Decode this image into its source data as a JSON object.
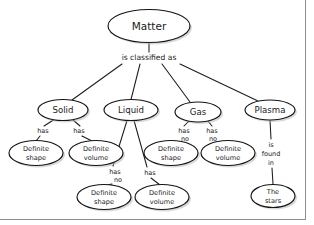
{
  "diagram": {
    "type": "concept-map",
    "ink_color": "#1a1a1a",
    "background_color": "#ffffff",
    "border_color": "#8d8d8d"
  },
  "nodes": {
    "root": {
      "label": "Matter",
      "cx": 149,
      "cy": 26,
      "rx": 41,
      "ry": 16.5
    },
    "solid": {
      "label": "Solid",
      "cx": 63,
      "cy": 110,
      "rx": 25,
      "ry": 10.5
    },
    "liquid": {
      "label": "Liquid",
      "cx": 131,
      "cy": 110,
      "rx": 27,
      "ry": 10.5
    },
    "gas": {
      "label": "Gas",
      "cx": 198,
      "cy": 112,
      "rx": 23,
      "ry": 10
    },
    "plasma": {
      "label": "Plasma",
      "cx": 270,
      "cy": 110,
      "rx": 25,
      "ry": 10
    },
    "solid_shape": {
      "line1": "Definite",
      "line2": "shape",
      "cx": 36,
      "cy": 153,
      "rx": 27,
      "ry": 12.5
    },
    "solid_volume": {
      "line1": "Definite",
      "line2": "volume",
      "cx": 96,
      "cy": 153,
      "rx": 27,
      "ry": 12.5
    },
    "gas_shape": {
      "line1": "Definite",
      "line2": "shape",
      "cx": 171,
      "cy": 153,
      "rx": 27,
      "ry": 12.5
    },
    "gas_volume": {
      "line1": "Definite",
      "line2": "volume",
      "cx": 228,
      "cy": 153,
      "rx": 27,
      "ry": 12.5
    },
    "liquid_shape": {
      "line1": "Definite",
      "line2": "shape",
      "cx": 104,
      "cy": 197,
      "rx": 27,
      "ry": 12.5
    },
    "liquid_volume": {
      "line1": "Definite",
      "line2": "volume",
      "cx": 162,
      "cy": 197,
      "rx": 27,
      "ry": 12.5
    },
    "stars": {
      "line1": "The",
      "line2": "stars",
      "cx": 273,
      "cy": 196,
      "rx": 22,
      "ry": 11.5
    }
  },
  "edge_labels": {
    "classified": {
      "text": "is classified as",
      "x": 149,
      "y": 58
    },
    "solid_shape": {
      "text": "has",
      "x": 43,
      "y": 131
    },
    "solid_volume": {
      "text": "has",
      "x": 79,
      "y": 131
    },
    "liquid_shape_1": {
      "text": "has",
      "x": 115,
      "y": 172
    },
    "liquid_shape_2": {
      "text": "no",
      "x": 118,
      "y": 180
    },
    "liquid_volume": {
      "text": "has",
      "x": 150,
      "y": 173
    },
    "gas_shape_1": {
      "text": "has",
      "x": 184,
      "y": 131
    },
    "gas_shape_2": {
      "text": "no",
      "x": 185,
      "y": 139
    },
    "gas_volume_1": {
      "text": "has",
      "x": 212,
      "y": 131
    },
    "gas_volume_2": {
      "text": "no",
      "x": 213,
      "y": 139
    },
    "plasma_1": {
      "text": "is",
      "x": 271,
      "y": 145
    },
    "plasma_2": {
      "text": "found",
      "x": 271,
      "y": 154
    },
    "plasma_3": {
      "text": "in",
      "x": 271,
      "y": 163
    }
  }
}
